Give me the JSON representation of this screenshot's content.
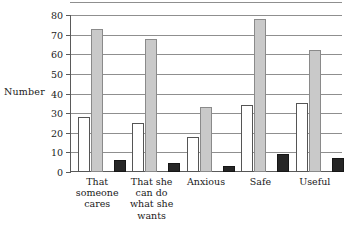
{
  "chart_data": {
    "type": "bar",
    "title": "",
    "xlabel": "",
    "ylabel": "Number",
    "ylim": [
      0,
      80
    ],
    "yticks": [
      0,
      10,
      20,
      30,
      40,
      50,
      60,
      70,
      80
    ],
    "grid": true,
    "legend": "none",
    "categories": [
      "That\nsomeone\ncares",
      "That she\ncan do\nwhat she\nwants",
      "Anxious",
      "Safe",
      "Useful"
    ],
    "series": [
      {
        "name": "white",
        "color": "#ffffff",
        "values": [
          28,
          25,
          18,
          34,
          35
        ]
      },
      {
        "name": "grey",
        "color": "#c9c9c9",
        "values": [
          73,
          68,
          33,
          78,
          62
        ]
      },
      {
        "name": "black",
        "color": "#262626",
        "values": [
          6,
          4.5,
          3,
          9,
          7
        ]
      }
    ]
  },
  "axis": {
    "y_label": "Number",
    "y_tick_labels": [
      "0",
      "10",
      "20",
      "30",
      "40",
      "50",
      "60",
      "70",
      "80"
    ]
  }
}
